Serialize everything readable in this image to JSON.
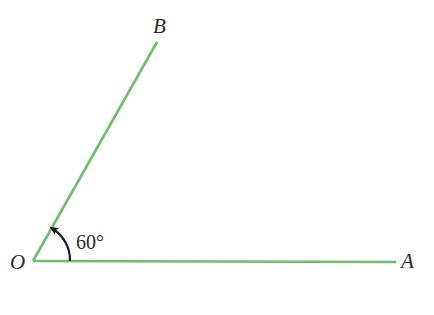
{
  "diagram": {
    "title": "",
    "colors": {
      "ray": "#6cbf6c",
      "arc": "#1a1a1a",
      "text": "#2a2a2a",
      "background": "#ffffff"
    },
    "points": {
      "O": {
        "label": "O",
        "x": 33,
        "y": 261
      },
      "A": {
        "label": "A",
        "x": 396,
        "y": 262
      },
      "B": {
        "label": "B",
        "x": 157,
        "y": 42
      }
    },
    "rays": [
      {
        "from": "O",
        "to": "A"
      },
      {
        "from": "O",
        "to": "B"
      }
    ],
    "angle": {
      "vertex": "O",
      "from": "A",
      "to": "B",
      "label": "60°",
      "direction": "counterclockwise"
    }
  }
}
